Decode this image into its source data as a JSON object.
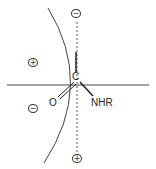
{
  "diagram": {
    "type": "sector-rule",
    "center_atom": "C",
    "substituents": {
      "carbonyl_oxygen": "O",
      "amide_group": "NHR"
    },
    "regions": [
      {
        "position": "top",
        "sign": "−"
      },
      {
        "position": "upper-left",
        "sign": "+"
      },
      {
        "position": "lower-left",
        "sign": "−"
      },
      {
        "position": "bottom",
        "sign": "+"
      }
    ],
    "colors": {
      "line": "#333333",
      "text": "#222222",
      "background": "#ffffff"
    }
  }
}
